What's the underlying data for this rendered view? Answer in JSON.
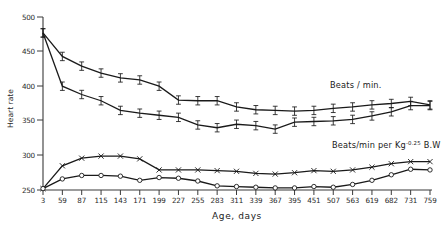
{
  "chart_data": {
    "type": "line",
    "title": "",
    "xlabel": "Age,   days",
    "ylabel": "Heart rate",
    "grid": false,
    "legend_position": "inline-annotation",
    "xlim": [
      0,
      21
    ],
    "ylim": [
      250,
      500
    ],
    "yticks": [
      250,
      300,
      350,
      400,
      450,
      500
    ],
    "categories": [
      "3",
      "59",
      "87",
      "115",
      "143",
      "171",
      "199",
      "227",
      "255",
      "283",
      "311",
      "339",
      "367",
      "395",
      "451",
      "507",
      "563",
      "619",
      "682",
      "731",
      "759"
    ],
    "x": [
      3,
      59,
      87,
      115,
      143,
      171,
      199,
      227,
      255,
      283,
      311,
      339,
      367,
      395,
      451,
      507,
      563,
      619,
      682,
      731,
      759
    ],
    "series": [
      {
        "name": "Beats / min. (upper)",
        "marker": "errorbar",
        "values": [
          477,
          443,
          429,
          419,
          412,
          409,
          400,
          380,
          379,
          379,
          370,
          366,
          365,
          364,
          365,
          368,
          370,
          373,
          375,
          378,
          373
        ]
      },
      {
        "name": "Beats / min. (lower)",
        "marker": "errorbar",
        "values": [
          477,
          400,
          388,
          379,
          365,
          361,
          358,
          355,
          344,
          340,
          345,
          343,
          338,
          348,
          349,
          350,
          352,
          357,
          363,
          372,
          372
        ]
      },
      {
        "name": "Beats/min per Kg^-0.25 B.W (upper)",
        "marker": "cross",
        "values": [
          252,
          285,
          296,
          299,
          299,
          295,
          279,
          279,
          279,
          278,
          277,
          274,
          273,
          275,
          278,
          277,
          279,
          283,
          288,
          291,
          291
        ]
      },
      {
        "name": "Beats/min per Kg^-0.25 B.W (lower)",
        "marker": "circle",
        "values": [
          252,
          266,
          271,
          271,
          270,
          264,
          268,
          267,
          263,
          256,
          255,
          254,
          253,
          253,
          255,
          254,
          258,
          264,
          272,
          280,
          279
        ]
      }
    ],
    "annotations": [
      {
        "name": "beats-per-min-label",
        "text": "Beats / min.",
        "x": 330,
        "y": 88
      },
      {
        "name": "beats-per-min-per-kg-label",
        "text_prefix": "Beats/min per Kg",
        "superscript": "-0.25",
        "text_suffix": " B.W",
        "x": 332,
        "y": 148
      }
    ],
    "colors": {
      "line": "#1a1a1a",
      "axis": "#3a3a3a",
      "text": "#1a1a1a"
    }
  }
}
